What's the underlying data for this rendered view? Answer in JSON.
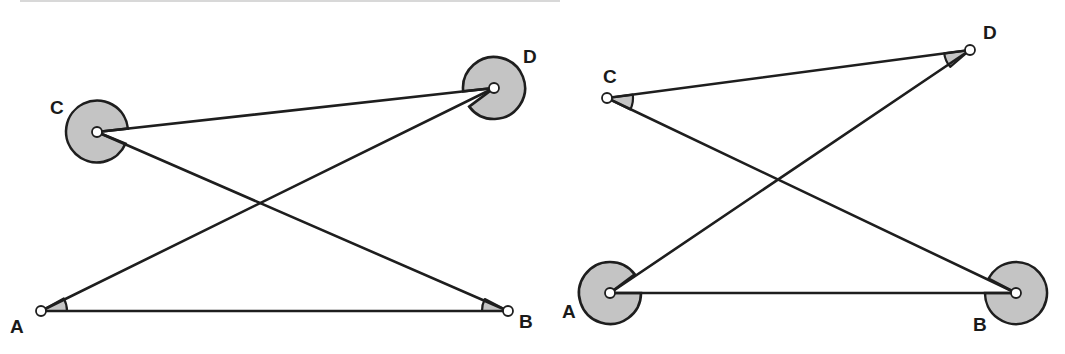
{
  "figure": {
    "colors": {
      "line": "#1e1e1e",
      "shade": "#c4c4c4",
      "point_fill": "#ffffff",
      "background": "#ffffff"
    },
    "left": {
      "labels": {
        "A": "A",
        "B": "B",
        "C": "C",
        "D": "D"
      },
      "points": {
        "A": [
          41,
          311
        ],
        "B": [
          508,
          311
        ],
        "C": [
          97,
          132
        ],
        "D": [
          494,
          88
        ]
      },
      "segments": [
        [
          "A",
          "B"
        ],
        [
          "C",
          "D"
        ],
        [
          "A",
          "D"
        ],
        [
          "C",
          "B"
        ]
      ],
      "reflex_angles_at": [
        "C",
        "D"
      ],
      "acute_angles_at": [
        "A",
        "B"
      ]
    },
    "right": {
      "labels": {
        "A": "A",
        "B": "B",
        "C": "C",
        "D": "D"
      },
      "points": {
        "A": [
          610,
          293
        ],
        "B": [
          1016,
          293
        ],
        "C": [
          607,
          98
        ],
        "D": [
          970,
          50
        ]
      },
      "segments": [
        [
          "A",
          "B"
        ],
        [
          "C",
          "D"
        ],
        [
          "A",
          "D"
        ],
        [
          "C",
          "B"
        ]
      ],
      "reflex_angles_at": [
        "A",
        "B"
      ],
      "acute_angles_at": [
        "C",
        "D"
      ]
    }
  }
}
